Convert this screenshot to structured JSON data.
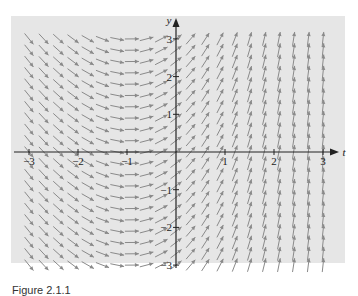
{
  "chart_data": {
    "type": "direction_field",
    "title": "",
    "xlabel": "t",
    "ylabel": "y",
    "xlim": [
      -3.3,
      3.5
    ],
    "ylim": [
      -3.4,
      3.4
    ],
    "x_ticks": [
      -3,
      -2,
      -1,
      1,
      2,
      3
    ],
    "y_ticks": [
      -3,
      -2,
      -1,
      1,
      2,
      3
    ],
    "x_tick_labels": [
      "−3",
      "−2",
      "−1",
      "1",
      "2",
      "3"
    ],
    "y_tick_labels": [
      "−3",
      "−2",
      "−1",
      "1",
      "2",
      "3"
    ],
    "grid": false,
    "background": "#e6e6e6",
    "arrow_color": "#8a8a8a",
    "sample_slopes": [
      {
        "t": -3,
        "slope": -1.6
      },
      {
        "t": -2,
        "slope": -0.9
      },
      {
        "t": -1,
        "slope": -0.1
      },
      {
        "t": 0,
        "slope": 1.0
      },
      {
        "t": 1,
        "slope": 2.7
      },
      {
        "t": 2,
        "slope": 6
      },
      {
        "t": 3,
        "slope": 12
      }
    ]
  },
  "caption": "Figure 2.1.1"
}
